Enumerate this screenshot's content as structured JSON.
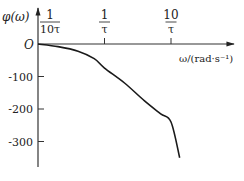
{
  "chart_data": {
    "type": "line",
    "title": "",
    "xlabel": "ω/(rad·s⁻¹)",
    "ylabel": "φ(ω)",
    "x_scale": "log",
    "origin_label": "O",
    "x_ticks": [
      {
        "value": 0.1,
        "num": "1",
        "den": "10τ"
      },
      {
        "value": 1,
        "num": "1",
        "den": "τ"
      },
      {
        "value": 10,
        "num": "10",
        "den": "τ"
      }
    ],
    "y_ticks": [
      {
        "value": -100,
        "label": "-100"
      },
      {
        "value": -200,
        "label": "-200"
      },
      {
        "value": -300,
        "label": "-300"
      }
    ],
    "ylim": [
      -385,
      0
    ],
    "series": [
      {
        "name": "φ(ω)",
        "x": [
          0.1,
          0.2,
          0.4,
          0.7,
          1,
          2,
          4,
          7,
          10,
          13.5
        ],
        "y": [
          0,
          -8,
          -22,
          -45,
          -74,
          -120,
          -175,
          -215,
          -240,
          -350
        ]
      }
    ],
    "grid": false,
    "legend": "none"
  },
  "caption": ""
}
